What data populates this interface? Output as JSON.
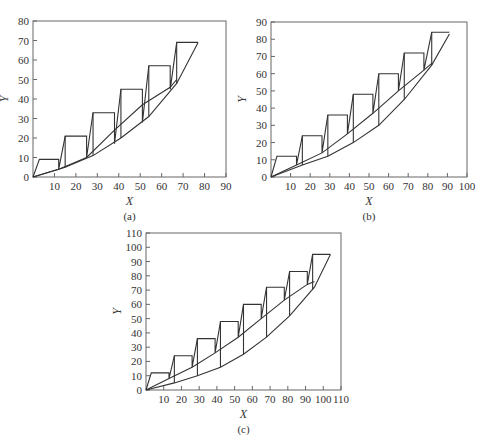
{
  "chart_data": [
    {
      "id": "a",
      "type": "line",
      "caption": "(a)",
      "xlabel": "X",
      "ylabel": "Y",
      "xlim": [
        0,
        90
      ],
      "ylim": [
        0,
        80
      ],
      "xticks": [
        10,
        20,
        30,
        40,
        50,
        60,
        70,
        80,
        90
      ],
      "yticks": [
        0,
        10,
        20,
        30,
        40,
        50,
        60,
        70,
        80
      ],
      "plot_box": {
        "x0": 33,
        "y0": 177,
        "x1": 226,
        "y1": 21
      },
      "grid": false,
      "series": [
        {
          "name": "operating-line",
          "points": [
            [
              0,
              0
            ],
            [
              12,
              4
            ],
            [
              25,
              10
            ],
            [
              38,
              24
            ],
            [
              51,
              37
            ],
            [
              64,
              46
            ],
            [
              67,
              50
            ]
          ]
        },
        {
          "name": "equilibrium-curve",
          "points": [
            [
              0,
              0
            ],
            [
              15,
              5
            ],
            [
              28,
              11
            ],
            [
              41,
              20
            ],
            [
              54,
              31
            ],
            [
              67,
              48
            ],
            [
              77,
              69
            ]
          ]
        },
        {
          "name": "steps",
          "points": [
            [
              0,
              0
            ],
            [
              3,
              9
            ],
            [
              12,
              9
            ],
            [
              12,
              4
            ],
            [
              15,
              21
            ],
            [
              25,
              21
            ],
            [
              25,
              10
            ],
            [
              28,
              33
            ],
            [
              38,
              33
            ],
            [
              38,
              17
            ],
            [
              41,
              45
            ],
            [
              51,
              45
            ],
            [
              51,
              28
            ],
            [
              54,
              57
            ],
            [
              64,
              57
            ],
            [
              64,
              45
            ],
            [
              67,
              69
            ],
            [
              77,
              69
            ]
          ]
        }
      ],
      "verticals": [
        [
          15,
          21,
          5
        ],
        [
          28,
          33,
          11
        ],
        [
          41,
          45,
          20
        ],
        [
          54,
          57,
          31
        ],
        [
          67,
          69,
          48
        ]
      ]
    },
    {
      "id": "b",
      "type": "line",
      "caption": "(b)",
      "xlabel": "X",
      "ylabel": "Y",
      "xlim": [
        0,
        100
      ],
      "ylim": [
        0,
        90
      ],
      "xticks": [
        10,
        20,
        30,
        40,
        50,
        60,
        70,
        80,
        90,
        100
      ],
      "yticks": [
        0,
        10,
        20,
        30,
        40,
        50,
        60,
        70,
        80,
        90
      ],
      "plot_box": {
        "x0": 271,
        "y0": 177,
        "x1": 467,
        "y1": 22
      },
      "grid": false,
      "series": [
        {
          "name": "operating-line",
          "points": [
            [
              0,
              0
            ],
            [
              13,
              7
            ],
            [
              26,
              14
            ],
            [
              39,
              25
            ],
            [
              52,
              37
            ],
            [
              65,
              50
            ],
            [
              78,
              62
            ],
            [
              82,
              66
            ]
          ]
        },
        {
          "name": "equilibrium-curve",
          "points": [
            [
              0,
              0
            ],
            [
              16,
              7
            ],
            [
              29,
              12
            ],
            [
              42,
              20
            ],
            [
              55,
              30
            ],
            [
              68,
              45
            ],
            [
              82,
              65
            ],
            [
              91,
              83
            ]
          ]
        },
        {
          "name": "steps",
          "points": [
            [
              0,
              0
            ],
            [
              3,
              12
            ],
            [
              13,
              12
            ],
            [
              13,
              7
            ],
            [
              16,
              24
            ],
            [
              26,
              24
            ],
            [
              26,
              14
            ],
            [
              29,
              36
            ],
            [
              39,
              36
            ],
            [
              39,
              25
            ],
            [
              42,
              48
            ],
            [
              52,
              48
            ],
            [
              52,
              37
            ],
            [
              55,
              60
            ],
            [
              65,
              60
            ],
            [
              65,
              50
            ],
            [
              68,
              72
            ],
            [
              78,
              72
            ],
            [
              78,
              62
            ],
            [
              82,
              84
            ],
            [
              91,
              84
            ]
          ]
        }
      ],
      "verticals": [
        [
          16,
          24,
          7
        ],
        [
          29,
          36,
          12
        ],
        [
          42,
          48,
          20
        ],
        [
          55,
          60,
          30
        ],
        [
          68,
          72,
          45
        ],
        [
          82,
          84,
          65
        ]
      ]
    },
    {
      "id": "c",
      "type": "line",
      "caption": "(c)",
      "xlabel": "X",
      "ylabel": "Y",
      "xlim": [
        0,
        110
      ],
      "ylim": [
        0,
        110
      ],
      "xticks": [
        10,
        20,
        30,
        40,
        50,
        60,
        70,
        80,
        90,
        100,
        110
      ],
      "yticks": [
        0,
        10,
        20,
        30,
        40,
        50,
        60,
        70,
        80,
        90,
        100,
        110
      ],
      "plot_box": {
        "x0": 146,
        "y0": 390,
        "x1": 341,
        "y1": 233
      },
      "grid": false,
      "series": [
        {
          "name": "operating-line",
          "points": [
            [
              0,
              0
            ],
            [
              13,
              8
            ],
            [
              26,
              16
            ],
            [
              39,
              26
            ],
            [
              52,
              37
            ],
            [
              65,
              50
            ],
            [
              78,
              63
            ],
            [
              91,
              74
            ],
            [
              95,
              76
            ]
          ]
        },
        {
          "name": "equilibrium-curve",
          "points": [
            [
              0,
              0
            ],
            [
              16,
              5
            ],
            [
              29,
              10
            ],
            [
              42,
              16
            ],
            [
              55,
              25
            ],
            [
              68,
              37
            ],
            [
              81,
              52
            ],
            [
              95,
              72
            ],
            [
              104,
              95
            ]
          ]
        },
        {
          "name": "steps",
          "points": [
            [
              0,
              0
            ],
            [
              3,
              12
            ],
            [
              13,
              12
            ],
            [
              13,
              8
            ],
            [
              16,
              24
            ],
            [
              26,
              24
            ],
            [
              26,
              16
            ],
            [
              29,
              36
            ],
            [
              39,
              36
            ],
            [
              39,
              26
            ],
            [
              42,
              48
            ],
            [
              52,
              48
            ],
            [
              52,
              37
            ],
            [
              55,
              60
            ],
            [
              65,
              60
            ],
            [
              65,
              50
            ],
            [
              68,
              72
            ],
            [
              78,
              72
            ],
            [
              78,
              63
            ],
            [
              81,
              83
            ],
            [
              91,
              83
            ],
            [
              91,
              74
            ],
            [
              94,
              95
            ],
            [
              104,
              95
            ]
          ]
        }
      ],
      "verticals": [
        [
          16,
          24,
          5
        ],
        [
          29,
          36,
          10
        ],
        [
          42,
          48,
          16
        ],
        [
          55,
          60,
          25
        ],
        [
          68,
          72,
          37
        ],
        [
          81,
          83,
          52
        ],
        [
          94,
          95,
          70
        ]
      ]
    }
  ]
}
